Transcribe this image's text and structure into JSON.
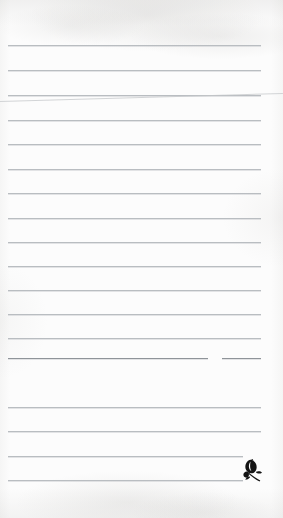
{
  "page": {
    "kind": "lined-notepaper-sheet",
    "width_px": 283,
    "height_px": 518,
    "written_content": "",
    "paper_color": "#fcfcfc",
    "rule_color": "#b9bdc1",
    "emblem_color": "#141414"
  },
  "rules": {
    "count": 18,
    "left_x": 8,
    "right_x": 261,
    "first_y": 45,
    "spacing_y": 24.5,
    "items": [
      {
        "y": 45,
        "left": 8,
        "right": 261,
        "style": "normal"
      },
      {
        "y": 70,
        "left": 8,
        "right": 261,
        "style": "normal"
      },
      {
        "y": 95,
        "left": 8,
        "right": 261,
        "style": "normal"
      },
      {
        "y": 120,
        "left": 8,
        "right": 261,
        "style": "normal"
      },
      {
        "y": 144,
        "left": 8,
        "right": 261,
        "style": "normal"
      },
      {
        "y": 169,
        "left": 8,
        "right": 261,
        "style": "normal"
      },
      {
        "y": 193,
        "left": 8,
        "right": 261,
        "style": "normal"
      },
      {
        "y": 218,
        "left": 8,
        "right": 261,
        "style": "normal"
      },
      {
        "y": 242,
        "left": 8,
        "right": 261,
        "style": "normal"
      },
      {
        "y": 266,
        "left": 8,
        "right": 261,
        "style": "normal"
      },
      {
        "y": 290,
        "left": 8,
        "right": 261,
        "style": "normal"
      },
      {
        "y": 314,
        "left": 8,
        "right": 261,
        "style": "normal"
      },
      {
        "y": 338,
        "left": 8,
        "right": 261,
        "style": "normal"
      },
      {
        "y": 358,
        "left": 8,
        "right": 261,
        "style": "accent-gap"
      },
      {
        "y": 407,
        "left": 8,
        "right": 261,
        "style": "normal"
      },
      {
        "y": 431,
        "left": 8,
        "right": 261,
        "style": "normal"
      },
      {
        "y": 456,
        "left": 8,
        "right": 243,
        "style": "short"
      },
      {
        "y": 480,
        "left": 8,
        "right": 243,
        "style": "short"
      }
    ]
  },
  "artifacts": {
    "crease": {
      "name": "diagonal-fold-crease",
      "start_x": 0,
      "start_y": 101,
      "end_x": 283,
      "end_y": 93
    },
    "accent_rule": {
      "name": "darkened-rule-segment",
      "y": 358,
      "segment_a": {
        "left": 8,
        "right": 208
      },
      "gap": {
        "left": 208,
        "right": 222
      },
      "segment_b": {
        "left": 222,
        "right": 261
      }
    }
  },
  "emblem": {
    "name": "leaf-sprig",
    "x": 241,
    "y": 459,
    "width": 22,
    "height": 23,
    "description": "small solid black leaf with crossing stem sprig"
  }
}
